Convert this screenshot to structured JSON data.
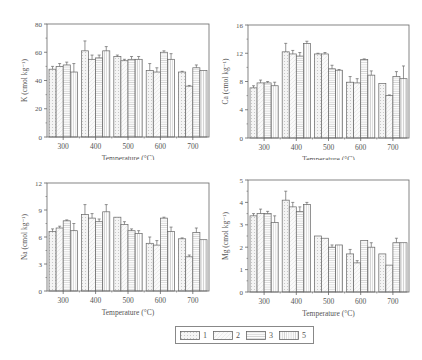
{
  "chart_data": [
    {
      "type": "bar",
      "panel": "top-left",
      "ylabel": "K (cmol kg⁻¹)",
      "xlabel": "Temperature (°C)",
      "ylim": [
        0,
        80
      ],
      "yticks": [
        0,
        20,
        40,
        60,
        80
      ],
      "categories": [
        "300",
        "400",
        "500",
        "600",
        "700"
      ],
      "series": [
        {
          "name": "1",
          "values": [
            48,
            61,
            57,
            47,
            46
          ],
          "errors": [
            2,
            7,
            1,
            5,
            0.5
          ]
        },
        {
          "name": "2",
          "values": [
            50,
            55,
            54,
            46,
            36
          ],
          "errors": [
            2,
            3,
            1,
            3,
            0.5
          ]
        },
        {
          "name": "3",
          "values": [
            51,
            56,
            55,
            60,
            49
          ],
          "errors": [
            2,
            2,
            2,
            1,
            2
          ]
        },
        {
          "name": "5",
          "values": [
            46,
            61,
            55,
            55,
            47
          ],
          "errors": [
            6,
            3,
            2,
            4,
            0
          ]
        }
      ]
    },
    {
      "type": "bar",
      "panel": "top-right",
      "ylabel": "Ca (cmol kg⁻¹)",
      "xlabel": "Temperature (°C)",
      "ylim": [
        0,
        16
      ],
      "yticks": [
        0,
        4,
        8,
        12,
        16
      ],
      "categories": [
        "300",
        "400",
        "500",
        "600",
        "700"
      ],
      "series": [
        {
          "name": "1",
          "values": [
            7.1,
            12.2,
            11.9,
            7.9,
            7.7
          ],
          "errors": [
            0.3,
            1.2,
            0.1,
            0.8,
            0
          ]
        },
        {
          "name": "2",
          "values": [
            7.8,
            11.9,
            11.9,
            7.8,
            6.0
          ],
          "errors": [
            0.4,
            0.5,
            0.2,
            0.6,
            0.1
          ]
        },
        {
          "name": "3",
          "values": [
            7.8,
            11.6,
            9.8,
            11.1,
            8.7
          ],
          "errors": [
            0.2,
            0.5,
            0.5,
            0.1,
            0.7
          ]
        },
        {
          "name": "5",
          "values": [
            7.4,
            13.4,
            9.6,
            8.9,
            8.4
          ],
          "errors": [
            0.5,
            0.3,
            0.1,
            0.6,
            1.8
          ]
        }
      ]
    },
    {
      "type": "bar",
      "panel": "bottom-left",
      "ylabel": "Na (cmol kg⁻¹)",
      "xlabel": "Temperature (°C)",
      "ylim": [
        0,
        12
      ],
      "yticks": [
        0,
        3,
        6,
        9,
        12
      ],
      "categories": [
        "300",
        "400",
        "500",
        "600",
        "700"
      ],
      "series": [
        {
          "name": "1",
          "values": [
            6.6,
            8.5,
            8.2,
            5.3,
            5.8
          ],
          "errors": [
            0.3,
            1.1,
            0,
            0.7,
            0.1
          ]
        },
        {
          "name": "2",
          "values": [
            7.0,
            8.1,
            7.4,
            5.1,
            3.8
          ],
          "errors": [
            0.2,
            0.5,
            0.3,
            0.5,
            0.2
          ]
        },
        {
          "name": "3",
          "values": [
            7.8,
            7.7,
            6.7,
            8.1,
            6.5
          ],
          "errors": [
            0.1,
            0.3,
            0.2,
            0.1,
            0.5
          ]
        },
        {
          "name": "5",
          "values": [
            6.7,
            8.8,
            6.4,
            6.6,
            5.7
          ],
          "errors": [
            0.8,
            0.8,
            0.3,
            0.5,
            0
          ]
        }
      ]
    },
    {
      "type": "bar",
      "panel": "bottom-right",
      "ylabel": "Mg (cmol kg⁻¹)",
      "xlabel": "Temperature (°C)",
      "ylim": [
        0,
        5
      ],
      "yticks": [
        0,
        1,
        2,
        3,
        4,
        5
      ],
      "categories": [
        "300",
        "400",
        "500",
        "600",
        "700"
      ],
      "series": [
        {
          "name": "1",
          "values": [
            3.4,
            4.1,
            2.5,
            1.7,
            1.7
          ],
          "errors": [
            0.1,
            0.4,
            0,
            0.2,
            0
          ]
        },
        {
          "name": "2",
          "values": [
            3.5,
            3.8,
            2.4,
            1.3,
            1.2
          ],
          "errors": [
            0.2,
            0.2,
            0,
            0.1,
            0
          ]
        },
        {
          "name": "3",
          "values": [
            3.5,
            3.6,
            2.0,
            2.3,
            2.2
          ],
          "errors": [
            0.1,
            0.2,
            0.1,
            0,
            0.2
          ]
        },
        {
          "name": "5",
          "values": [
            3.1,
            3.9,
            2.1,
            2.0,
            2.2
          ],
          "errors": [
            0.3,
            0.1,
            0,
            0.2,
            0
          ]
        }
      ]
    }
  ],
  "legend": {
    "items": [
      {
        "label": "1",
        "pattern": "dots"
      },
      {
        "label": "2",
        "pattern": "light"
      },
      {
        "label": "3",
        "pattern": "hlines"
      },
      {
        "label": "5",
        "pattern": "vlines"
      }
    ]
  }
}
